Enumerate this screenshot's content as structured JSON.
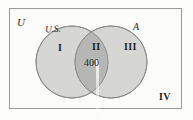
{
  "diagram": {
    "type": "venn",
    "universe_label": "U",
    "sets": [
      {
        "id": "left",
        "label": "U.S."
      },
      {
        "id": "right",
        "label": "A"
      }
    ],
    "regions": [
      {
        "id": "left-only",
        "numeral": "I",
        "value": ""
      },
      {
        "id": "intersection",
        "numeral": "II",
        "value": "400"
      },
      {
        "id": "right-only",
        "numeral": "III",
        "value": ""
      },
      {
        "id": "outside",
        "numeral": "IV",
        "value": ""
      }
    ],
    "colors": {
      "circle_fill": "#d6d6d4",
      "intersection_fill": "#b6b6b4",
      "circle_stroke": "#8c8c8a",
      "rect_stroke": "#9a9a9a",
      "background": "#fdfdfc",
      "text": "#1f1f1f"
    }
  }
}
